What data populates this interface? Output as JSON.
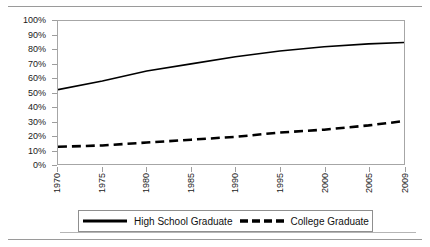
{
  "chart_data": {
    "type": "line",
    "title": "",
    "xlabel": "",
    "ylabel": "",
    "x": [
      1970,
      1975,
      1980,
      1985,
      1990,
      1995,
      2000,
      2005,
      2009
    ],
    "xtick_labels": [
      "1970",
      "1975",
      "1980",
      "1985",
      "1990",
      "1995",
      "2000",
      "2005",
      "2009"
    ],
    "ytick_labels": [
      "100%",
      "90%",
      "80%",
      "70%",
      "60%",
      "50%",
      "40%",
      "30%",
      "20%",
      "10%",
      "0%"
    ],
    "ytick_values": [
      100,
      90,
      80,
      70,
      60,
      50,
      40,
      30,
      20,
      10,
      0
    ],
    "ylim": [
      0,
      100
    ],
    "xlim": [
      1970,
      2009
    ],
    "grid": false,
    "legend_position": "bottom",
    "series": [
      {
        "name": "High School Graduate",
        "style": "solid",
        "color": "#000000",
        "values": [
          52,
          58,
          65,
          70,
          75,
          79,
          82,
          84,
          85
        ]
      },
      {
        "name": "College Graduate",
        "style": "dashed",
        "color": "#000000",
        "values": [
          12,
          13,
          15,
          17,
          19,
          22,
          24,
          27,
          30
        ]
      }
    ]
  },
  "legend": {
    "items": [
      {
        "label": "High School Graduate",
        "style": "solid"
      },
      {
        "label": "College Graduate",
        "style": "dashed"
      }
    ]
  }
}
